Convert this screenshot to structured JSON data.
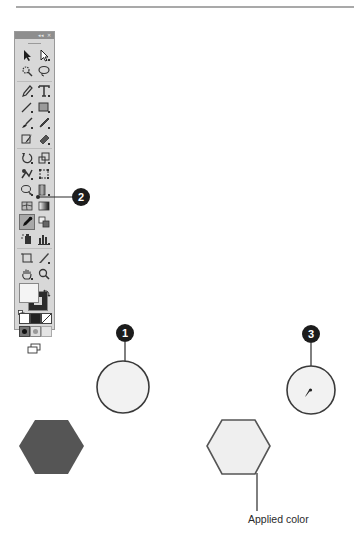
{
  "page": {
    "top_rule": true
  },
  "tools_panel": {
    "header_controls": [
      "collapse-icon",
      "close-icon"
    ],
    "header_collapse_label": "◂◂",
    "header_close_label": "✕",
    "rows": [
      [
        "selection-tool",
        "direct-selection-tool"
      ],
      [
        "magic-wand-tool",
        "lasso-tool"
      ],
      [
        "pen-tool",
        "type-tool"
      ],
      [
        "line-segment-tool",
        "rectangle-tool"
      ],
      [
        "paintbrush-tool",
        "pencil-tool"
      ],
      [
        "blob-brush-tool",
        "eraser-tool"
      ],
      [
        "rotate-tool",
        "scale-tool"
      ],
      [
        "warp-tool",
        "free-transform-tool"
      ],
      [
        "shape-builder-tool",
        "perspective-grid-tool"
      ],
      [
        "mesh-tool",
        "gradient-tool"
      ],
      [
        "eyedropper-tool",
        "blend-tool"
      ],
      [
        "symbol-sprayer-tool",
        "column-graph-tool"
      ],
      [
        "artboard-tool",
        "slice-tool"
      ],
      [
        "hand-tool",
        "zoom-tool"
      ]
    ],
    "selected_tool": "eyedropper-tool",
    "fill_color": "#f4f4f4",
    "stroke_color": "#2b2b2b",
    "color_modes": [
      "color",
      "gradient",
      "none"
    ],
    "drawing_modes": [
      "draw-normal",
      "draw-behind",
      "draw-inside"
    ],
    "screen_mode": "change-screen-mode"
  },
  "callouts": [
    {
      "number": "1",
      "target": "source-circle"
    },
    {
      "number": "2",
      "target": "eyedropper-tool"
    },
    {
      "number": "3",
      "target": "eyedropper-cursor-circle"
    }
  ],
  "artwork": {
    "source_circle_fill": "#f2f2f2",
    "target_circle_fill": "#f2f2f2",
    "original_hexagon_fill": "#555555",
    "applied_hexagon_fill": "#efefef",
    "applied_hexagon_stroke": "#555555"
  },
  "labels": {
    "applied_color": "Applied color"
  },
  "colors": {
    "callout_bg": "#1c1c1c",
    "panel_bg": "#d8d8d8",
    "panel_header": "#8e8e8e",
    "line": "#2a2a2a"
  }
}
